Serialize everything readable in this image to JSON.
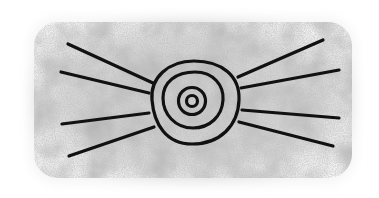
{
  "image": {
    "description": "Hand-drawn black sun/eye symbol: three concentric rings with small inner dot ring, four rays extending left and four rays extending right, on a grainy grey stone-like textured background",
    "colors": {
      "background": "#ffffff",
      "texture": "#c8c8c8",
      "texture_dark": "#8a8a8a",
      "stroke": "#111111"
    },
    "symbol": {
      "center": [
        192,
        101
      ],
      "rings": [
        {
          "name": "outer",
          "rx": 44,
          "ry": 42
        },
        {
          "name": "middle",
          "rx": 30,
          "ry": 28
        },
        {
          "name": "inner",
          "rx": 14,
          "ry": 14
        },
        {
          "name": "core",
          "rx": 6,
          "ry": 6
        }
      ],
      "rays_left": [
        [
          [
            68,
            44
          ],
          [
            153,
            83
          ]
        ],
        [
          [
            61,
            72
          ],
          [
            149,
            93
          ]
        ],
        [
          [
            62,
            124
          ],
          [
            149,
            113
          ]
        ],
        [
          [
            69,
            156
          ],
          [
            154,
            127
          ]
        ]
      ],
      "rays_right": [
        [
          [
            238,
            77
          ],
          [
            323,
            40
          ]
        ],
        [
          [
            241,
            88
          ],
          [
            339,
            70
          ]
        ],
        [
          [
            242,
            110
          ],
          [
            339,
            118
          ]
        ],
        [
          [
            239,
            122
          ],
          [
            333,
            146
          ]
        ]
      ]
    }
  }
}
